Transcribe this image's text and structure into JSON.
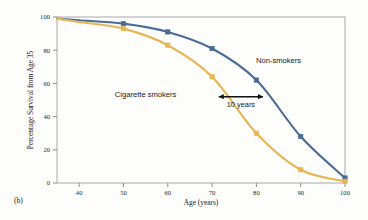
{
  "figure": {
    "panel_label": "(b)",
    "background_color": "#fdfdfc",
    "frame_color": "#a8a8a8"
  },
  "chart_data": {
    "type": "line",
    "title": "",
    "xlabel": "Age (years)",
    "ylabel": "Percentage Survival from Age 35",
    "xlim": [
      35,
      100
    ],
    "ylim": [
      0,
      100
    ],
    "xticks": [
      40,
      50,
      60,
      70,
      80,
      90,
      100
    ],
    "yticks": [
      0,
      20,
      40,
      60,
      80,
      100
    ],
    "grid": false,
    "legend_position": "inline-labels",
    "x": [
      35,
      40,
      50,
      60,
      70,
      80,
      90,
      100
    ],
    "series": [
      {
        "name": "Non-smokers",
        "color": "#4a6b96",
        "marker": "square",
        "values": [
          99,
          98,
          96,
          91,
          81,
          62,
          28,
          3
        ],
        "label_x": 85,
        "label_y": 72
      },
      {
        "name": "Cigarette smokers",
        "color": "#e8b554",
        "marker": "square",
        "values": [
          99,
          97,
          93,
          83,
          64,
          30,
          8,
          1
        ],
        "label_x": 55,
        "label_y": 52
      }
    ],
    "annotations": [
      {
        "text": "10 years",
        "type": "double-arrow",
        "x_start": 71.5,
        "x_end": 81.5,
        "y": 52,
        "color": "#111111"
      }
    ]
  },
  "tick_labels": {
    "x": [
      "40",
      "50",
      "60",
      "70",
      "80",
      "90",
      "100"
    ],
    "y": [
      "0",
      "20",
      "40",
      "60",
      "80",
      "100"
    ]
  }
}
